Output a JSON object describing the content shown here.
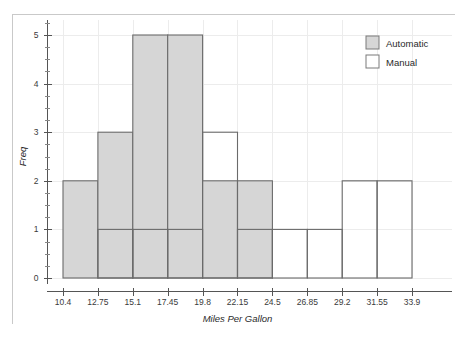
{
  "chart_data": {
    "type": "bar",
    "chart_subtype": "overlaid-histogram",
    "title": "",
    "xlabel": "Miles Per Gallon",
    "ylabel": "Freq",
    "xlim": [
      10.4,
      33.9
    ],
    "ylim": [
      0,
      5
    ],
    "bin_width": 2.35,
    "bin_edges": [
      10.4,
      12.75,
      15.1,
      17.45,
      19.8,
      22.15,
      24.5,
      26.85,
      29.2,
      31.55,
      33.9
    ],
    "x_tick_labels": [
      "10.4",
      "12.75",
      "15.1",
      "17.45",
      "19.8",
      "22.15",
      "24.5",
      "26.85",
      "29.2",
      "31.55",
      "33.9"
    ],
    "y_tick_labels": [
      "0",
      "1",
      "2",
      "3",
      "4",
      "5"
    ],
    "y_ticks": [
      0,
      1,
      2,
      3,
      4,
      5
    ],
    "y_minor_ticks": [
      0.25,
      0.5,
      0.75,
      1.25,
      1.5,
      1.75,
      2.25,
      2.5,
      2.75,
      3.25,
      3.5,
      3.75,
      4.25,
      4.5,
      4.75,
      5.25
    ],
    "grid": true,
    "legend_position": "top-right",
    "series": [
      {
        "name": "Automatic",
        "fill_color": "#d6d6d6",
        "edge_color": "#6b6b6b",
        "values": [
          2,
          3,
          5,
          5,
          2,
          2,
          0,
          0,
          0,
          0
        ]
      },
      {
        "name": "Manual",
        "fill_color": "#ffffff",
        "edge_color": "#6b6b6b",
        "values": [
          0,
          1,
          1,
          1,
          3,
          1,
          1,
          1,
          2,
          2
        ]
      }
    ]
  },
  "legend": {
    "items": [
      {
        "label": "Automatic",
        "swatch": "filled-gray"
      },
      {
        "label": "Manual",
        "swatch": "outline-white"
      }
    ]
  },
  "axes": {
    "x_title": "Miles Per Gallon",
    "y_title": "Freq"
  },
  "colors": {
    "automatic_fill": "#d6d6d6",
    "bar_edge": "#6b6b6b",
    "axis": "#555555",
    "grid": "#ececec",
    "frame": "#c9c9c9",
    "background": "#ffffff"
  }
}
